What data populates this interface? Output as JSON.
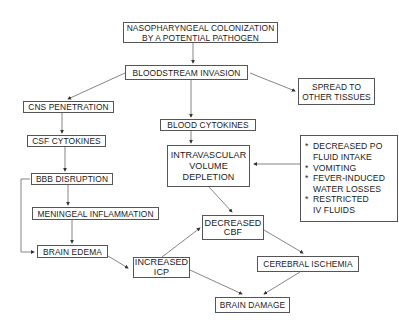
{
  "nodes": {
    "colonization": {
      "line1": "NASOPHARYNGEAL COLONIZATION",
      "line2": "BY A POTENTIAL PATHOGEN"
    },
    "bloodstream": {
      "label": "BLOODSTREAM INVASION"
    },
    "spread": {
      "line1": "SPREAD TO",
      "line2": "OTHER TISSUES"
    },
    "cns": {
      "label": "CNS PENETRATION"
    },
    "csf": {
      "label": "CSF CYTOKINES"
    },
    "bbb": {
      "label": "BBB DISRUPTION"
    },
    "meningeal": {
      "label": "MENINGEAL INFLAMMATION"
    },
    "edema": {
      "label": "BRAIN EDEMA"
    },
    "blood_cytokines": {
      "label": "BLOOD CYTOKINES"
    },
    "intravascular": {
      "line1": "INTRAVASCULAR",
      "line2": "VOLUME",
      "line3": "DEPLETION"
    },
    "causes": {
      "bullet": "*",
      "items": [
        {
          "line1": "DECREASED PO",
          "line2": "FLUID INTAKE"
        },
        {
          "line1": "VOMITING"
        },
        {
          "line1": "FEVER-INDUCED",
          "line2": "WATER LOSSES"
        },
        {
          "line1": "RESTRICTED",
          "line2": "IV FLUIDS"
        }
      ]
    },
    "cbf": {
      "line1": "DECREASED",
      "line2": "CBF"
    },
    "icp": {
      "line1": "INCREASED",
      "line2": "ICP"
    },
    "ischemia": {
      "label": "CEREBRAL ISCHEMIA"
    },
    "damage": {
      "label": "BRAIN DAMAGE"
    }
  },
  "colors": {
    "line": "#555555",
    "text": "#1a1a1a",
    "background": "#ffffff"
  }
}
